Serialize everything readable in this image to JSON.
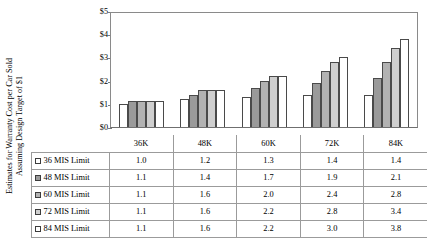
{
  "axis_title": {
    "line1": "Estimates for Warranty Cost per Car Sold",
    "line2": "Assuming Design Target of $1"
  },
  "chart_data": {
    "type": "bar",
    "title": "",
    "xlabel": "",
    "ylabel": "Estimates for Warranty Cost per Car Sold Assuming Design Target of $1",
    "categories": [
      "36K",
      "48K",
      "60K",
      "72K",
      "84K"
    ],
    "ylim": [
      0,
      5
    ],
    "ytick_labels": [
      "$0",
      "$1",
      "$2",
      "$3",
      "$4",
      "$5"
    ],
    "ytick_values": [
      0,
      1,
      2,
      3,
      4,
      5
    ],
    "grid": false,
    "legend_position": "table-below",
    "series": [
      {
        "name": "36 MIS Limit",
        "color": "#ffffff",
        "values": [
          1.0,
          1.2,
          1.3,
          1.4,
          1.4
        ]
      },
      {
        "name": "48 MIS Limit",
        "color": "#9a9a9a",
        "values": [
          1.1,
          1.4,
          1.7,
          1.9,
          2.1
        ]
      },
      {
        "name": "60 MIS Limit",
        "color": "#b2b2b2",
        "values": [
          1.1,
          1.6,
          2.0,
          2.4,
          2.8
        ]
      },
      {
        "name": "72 MIS Limit",
        "color": "#cfcfcf",
        "values": [
          1.1,
          1.6,
          2.2,
          2.8,
          3.4
        ]
      },
      {
        "name": "84 MIS Limit",
        "color": "#ffffff",
        "values": [
          1.1,
          1.6,
          2.2,
          3.0,
          3.8
        ]
      }
    ]
  },
  "table": {
    "corner": "",
    "columns": [
      "36K",
      "48K",
      "60K",
      "72K",
      "84K"
    ],
    "rows": [
      {
        "label": "36 MIS Limit",
        "swatch": "#ffffff",
        "values": [
          "1.0",
          "1.2",
          "1.3",
          "1.4",
          "1.4"
        ]
      },
      {
        "label": "48 MIS Limit",
        "swatch": "#9a9a9a",
        "values": [
          "1.1",
          "1.4",
          "1.7",
          "1.9",
          "2.1"
        ]
      },
      {
        "label": "60 MIS Limit",
        "swatch": "#b2b2b2",
        "values": [
          "1.1",
          "1.6",
          "2.0",
          "2.4",
          "2.8"
        ]
      },
      {
        "label": "72 MIS Limit",
        "swatch": "#cfcfcf",
        "values": [
          "1.1",
          "1.6",
          "2.2",
          "2.8",
          "3.4"
        ]
      },
      {
        "label": "84 MIS Limit",
        "swatch": "#ffffff",
        "values": [
          "1.1",
          "1.6",
          "2.2",
          "3.0",
          "3.8"
        ]
      }
    ]
  }
}
